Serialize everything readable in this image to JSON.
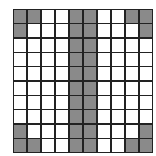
{
  "grid": {
    "rows": 10,
    "cols": 10,
    "colors": {
      "filled": "#8a8a8a",
      "empty": "#ffffff",
      "line": "#222222"
    },
    "cells": [
      [
        1,
        1,
        0,
        0,
        1,
        1,
        0,
        0,
        1,
        1
      ],
      [
        1,
        0,
        0,
        0,
        1,
        1,
        0,
        0,
        0,
        1
      ],
      [
        0,
        0,
        0,
        0,
        1,
        1,
        0,
        0,
        0,
        0
      ],
      [
        0,
        0,
        0,
        0,
        1,
        1,
        0,
        0,
        0,
        0
      ],
      [
        0,
        0,
        0,
        0,
        1,
        1,
        0,
        0,
        0,
        0
      ],
      [
        0,
        0,
        0,
        0,
        1,
        1,
        0,
        0,
        0,
        0
      ],
      [
        0,
        0,
        0,
        0,
        1,
        1,
        0,
        0,
        0,
        0
      ],
      [
        0,
        0,
        0,
        0,
        1,
        1,
        0,
        0,
        0,
        0
      ],
      [
        1,
        0,
        0,
        0,
        1,
        1,
        0,
        0,
        0,
        1
      ],
      [
        1,
        1,
        0,
        0,
        1,
        1,
        0,
        0,
        1,
        1
      ]
    ]
  }
}
